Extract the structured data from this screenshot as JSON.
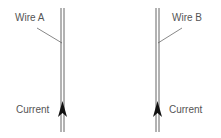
{
  "diagram": {
    "wires": [
      {
        "name": "Wire A",
        "current_label": "Current",
        "current_direction": "up"
      },
      {
        "name": "Wire B",
        "current_label": "Current",
        "current_direction": "up"
      }
    ],
    "colors": {
      "wire": "#555555",
      "arrow": "#111111",
      "text": "#555555"
    }
  }
}
